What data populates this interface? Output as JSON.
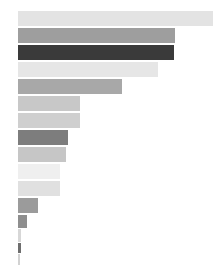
{
  "chart_data": {
    "type": "bar",
    "orientation": "horizontal",
    "title": "",
    "subtitle": "",
    "xlabel": "",
    "ylabel": "",
    "grid": false,
    "legend": null,
    "axis_visible": false,
    "tick_labels": [],
    "background_color": "#ffffff",
    "plot_origin_x_px": 18,
    "xlim": [
      0,
      196
    ],
    "categories": [
      "1",
      "2",
      "3",
      "4",
      "5",
      "6",
      "7",
      "8",
      "9",
      "10",
      "11",
      "12",
      "13",
      "14",
      "15",
      "16"
    ],
    "values": [
      195,
      157,
      156,
      140,
      104,
      62,
      62,
      50,
      48,
      42,
      42,
      20,
      9,
      3,
      3,
      2
    ],
    "bars": [
      {
        "index": 1,
        "value": 195,
        "color": "#e3e3e3",
        "top_px": 11,
        "height_px": 15,
        "width_px": 195
      },
      {
        "index": 2,
        "value": 157,
        "color": "#9e9e9e",
        "top_px": 28,
        "height_px": 15,
        "width_px": 157
      },
      {
        "index": 3,
        "value": 156,
        "color": "#3a3a3a",
        "top_px": 45,
        "height_px": 15,
        "width_px": 156
      },
      {
        "index": 4,
        "value": 140,
        "color": "#e6e6e6",
        "top_px": 62,
        "height_px": 15,
        "width_px": 140
      },
      {
        "index": 5,
        "value": 104,
        "color": "#a8a8a8",
        "top_px": 79,
        "height_px": 15,
        "width_px": 104
      },
      {
        "index": 6,
        "value": 62,
        "color": "#c8c8c8",
        "top_px": 96,
        "height_px": 15,
        "width_px": 62
      },
      {
        "index": 7,
        "value": 62,
        "color": "#cfcfcf",
        "top_px": 113,
        "height_px": 15,
        "width_px": 62
      },
      {
        "index": 8,
        "value": 50,
        "color": "#7d7d7d",
        "top_px": 130,
        "height_px": 15,
        "width_px": 50
      },
      {
        "index": 9,
        "value": 48,
        "color": "#c6c6c6",
        "top_px": 147,
        "height_px": 15,
        "width_px": 48
      },
      {
        "index": 10,
        "value": 42,
        "color": "#efefef",
        "top_px": 164,
        "height_px": 15,
        "width_px": 42
      },
      {
        "index": 11,
        "value": 42,
        "color": "#e0e0e0",
        "top_px": 181,
        "height_px": 15,
        "width_px": 42
      },
      {
        "index": 12,
        "value": 20,
        "color": "#9b9b9b",
        "top_px": 198,
        "height_px": 15,
        "width_px": 20
      },
      {
        "index": 13,
        "value": 9,
        "color": "#8e8e8e",
        "top_px": 215,
        "height_px": 13,
        "width_px": 9
      },
      {
        "index": 14,
        "value": 3,
        "color": "#d7d7d7",
        "top_px": 229,
        "height_px": 13,
        "width_px": 3
      },
      {
        "index": 15,
        "value": 3,
        "color": "#6e6e6e",
        "top_px": 243,
        "height_px": 10,
        "width_px": 3
      },
      {
        "index": 16,
        "value": 2,
        "color": "#d2d2d2",
        "top_px": 254,
        "height_px": 11,
        "width_px": 2
      }
    ]
  }
}
